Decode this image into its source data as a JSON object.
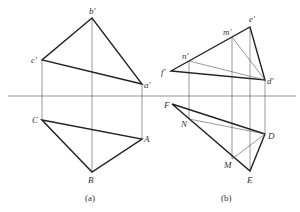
{
  "figure_a": {
    "caption": "(a)",
    "labels": {
      "b_prime": "b'",
      "c_prime": "c'",
      "a_prime": "a'",
      "C": "C",
      "A": "A",
      "B": "B"
    }
  },
  "figure_b": {
    "caption": "(b)",
    "labels": {
      "e_prime": "e'",
      "m_prime": "m'",
      "n_prime": "n'",
      "f_prime": "f'",
      "d_prime": "d'",
      "F": "F",
      "N": "N",
      "D": "D",
      "M": "M",
      "E": "E"
    }
  }
}
